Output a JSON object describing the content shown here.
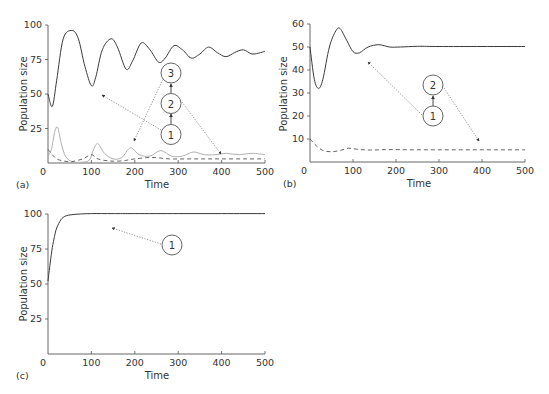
{
  "chart_data": [
    {
      "panel": "(a)",
      "type": "line",
      "title": "",
      "xlabel": "Time",
      "ylabel": "Population size",
      "xlim": [
        0,
        500
      ],
      "ylim": [
        0,
        100
      ],
      "xticks": [
        "0",
        "100",
        "200",
        "300",
        "400",
        "500"
      ],
      "yticks": [
        "25",
        "50",
        "75",
        "100"
      ],
      "grid": false,
      "series": [
        {
          "name": "species 1 (solid dark)",
          "style": "solid-dark",
          "x": [
            0,
            10,
            20,
            35,
            55,
            70,
            85,
            100,
            110,
            125,
            145,
            160,
            180,
            195,
            215,
            235,
            255,
            270,
            290,
            310,
            330,
            350,
            370,
            390,
            410,
            430,
            450,
            470,
            490,
            500
          ],
          "y": [
            50,
            41,
            60,
            90,
            96,
            90,
            70,
            56,
            62,
            82,
            90,
            84,
            68,
            74,
            87,
            82,
            73,
            76,
            85,
            82,
            76,
            79,
            84,
            80,
            77,
            80,
            82,
            79,
            80,
            81
          ]
        },
        {
          "name": "species 2 (solid light gray)",
          "style": "solid-light",
          "x": [
            0,
            8,
            15,
            22,
            30,
            40,
            55,
            75,
            95,
            105,
            115,
            130,
            150,
            170,
            190,
            210,
            235,
            260,
            285,
            310,
            335,
            360,
            385,
            410,
            440,
            470,
            500
          ],
          "y": [
            5,
            10,
            22,
            26,
            15,
            5,
            1,
            0.5,
            2,
            10,
            14,
            7,
            3,
            4,
            11,
            6,
            5,
            9,
            5,
            5,
            8,
            6,
            6,
            7,
            6,
            7,
            6
          ]
        },
        {
          "name": "species 3 (dashed)",
          "style": "dashed",
          "x": [
            0,
            10,
            20,
            35,
            55,
            80,
            100,
            115,
            140,
            170,
            200,
            240,
            280,
            320,
            360,
            400,
            450,
            500
          ],
          "y": [
            10,
            6,
            3,
            1.5,
            1,
            3,
            6,
            3,
            1.5,
            1.5,
            3,
            4,
            3,
            3,
            3,
            3,
            3,
            3
          ]
        }
      ],
      "annotations": {
        "nodes": [
          "1",
          "2",
          "3"
        ],
        "links": [
          [
            "1",
            "2"
          ],
          [
            "2",
            "3"
          ]
        ],
        "pointers": [
          {
            "from": "1",
            "to_series": "species 1 (solid dark)"
          },
          {
            "from": "3",
            "to_series": "species 2 (solid light gray)"
          },
          {
            "from": "2",
            "to_series": "species 3 (dashed)"
          }
        ]
      }
    },
    {
      "panel": "(b)",
      "type": "line",
      "title": "",
      "xlabel": "Time",
      "ylabel": "Population size",
      "xlim": [
        0,
        500
      ],
      "ylim": [
        0,
        60
      ],
      "xticks": [
        "0",
        "100",
        "200",
        "300",
        "400",
        "500"
      ],
      "yticks": [
        "10",
        "20",
        "30",
        "40",
        "50",
        "60"
      ],
      "grid": false,
      "series": [
        {
          "name": "species 1 (solid)",
          "style": "solid-dark",
          "x": [
            0,
            10,
            20,
            30,
            45,
            60,
            70,
            85,
            100,
            115,
            135,
            160,
            185,
            210,
            250,
            300,
            400,
            500
          ],
          "y": [
            50,
            36,
            32,
            36,
            50,
            57,
            58,
            53,
            48,
            47.5,
            50,
            51,
            50,
            50,
            50.3,
            50.2,
            50.2,
            50.2
          ]
        },
        {
          "name": "species 2 (dashed)",
          "style": "dashed",
          "x": [
            0,
            15,
            30,
            50,
            70,
            90,
            110,
            140,
            180,
            250,
            350,
            500
          ],
          "y": [
            10,
            7,
            5,
            4.5,
            5,
            6,
            5.5,
            5.2,
            5.4,
            5.3,
            5.3,
            5.3
          ]
        }
      ],
      "annotations": {
        "nodes": [
          "1",
          "2"
        ],
        "links": [
          [
            "1",
            "2"
          ]
        ],
        "pointers": [
          {
            "from": "1",
            "to_series": "species 1 (solid)"
          },
          {
            "from": "2",
            "to_series": "species 2 (dashed)"
          }
        ]
      }
    },
    {
      "panel": "(c)",
      "type": "line",
      "title": "",
      "xlabel": "Time",
      "ylabel": "Population size",
      "xlim": [
        0,
        500
      ],
      "ylim": [
        0,
        100
      ],
      "xticks": [
        "0",
        "100",
        "200",
        "300",
        "400",
        "500"
      ],
      "yticks": [
        "25",
        "50",
        "75",
        "100"
      ],
      "grid": false,
      "series": [
        {
          "name": "species 1 (solid)",
          "style": "solid-dark",
          "x": [
            0,
            5,
            10,
            15,
            20,
            30,
            40,
            55,
            75,
            100,
            150,
            200,
            300,
            400,
            500
          ],
          "y": [
            52,
            65,
            76,
            84,
            90,
            96,
            98.5,
            99.5,
            100,
            100.3,
            100.3,
            100.3,
            100.3,
            100.3,
            100.3
          ]
        }
      ],
      "annotations": {
        "nodes": [
          "1"
        ],
        "links": [],
        "pointers": [
          {
            "from": "1",
            "to_series": "species 1 (solid)"
          }
        ]
      }
    }
  ],
  "panels": {
    "a": {
      "label": "(a)",
      "xlabel": "Time",
      "ylabel": "Population size",
      "xticks": [
        "0",
        "100",
        "200",
        "300",
        "400",
        "500"
      ],
      "yticks": [
        "25",
        "50",
        "75",
        "100"
      ],
      "nodes": [
        "1",
        "2",
        "3"
      ]
    },
    "b": {
      "label": "(b)",
      "xlabel": "Time",
      "ylabel": "Population size",
      "xticks": [
        "0",
        "100",
        "200",
        "300",
        "400",
        "500"
      ],
      "yticks": [
        "10",
        "20",
        "30",
        "40",
        "50",
        "60"
      ],
      "nodes": [
        "1",
        "2"
      ]
    },
    "c": {
      "label": "(c)",
      "xlabel": "Time",
      "ylabel": "Population size",
      "xticks": [
        "0",
        "100",
        "200",
        "300",
        "400",
        "500"
      ],
      "yticks": [
        "25",
        "50",
        "75",
        "100"
      ],
      "nodes": [
        "1"
      ]
    }
  }
}
